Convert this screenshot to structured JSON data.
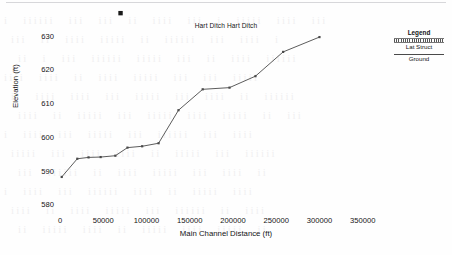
{
  "figure": {
    "title": "Hart Ditch Hart Ditch",
    "x_axis_title": "Main Channel Distance (ft)",
    "y_axis_title": "Elevation (ft)"
  },
  "legend": {
    "title": "Legend",
    "entries": [
      {
        "label": "Lat Struct",
        "style": "hatched-band",
        "color": "#555555"
      },
      {
        "label": "Ground",
        "style": "solid-line",
        "color": "#4a4a4a"
      }
    ]
  },
  "chart_data": {
    "type": "line",
    "title": "Hart Ditch Hart Ditch",
    "xlabel": "Main Channel Distance (ft)",
    "ylabel": "Elevation (ft)",
    "xlim": [
      0,
      370000
    ],
    "ylim": [
      578,
      632
    ],
    "xticks": [
      0,
      50000,
      100000,
      150000,
      200000,
      250000,
      300000,
      350000
    ],
    "xtick_labels": [
      "0",
      "50000",
      "100000",
      "150000",
      "200000",
      "250000",
      "300000",
      "350000"
    ],
    "yticks": [
      580,
      590,
      600,
      610,
      620,
      630
    ],
    "ytick_labels": [
      "580",
      "590",
      "600",
      "610",
      "620",
      "630"
    ],
    "grid": false,
    "axis_spines": false,
    "legend_position": "right-outside",
    "series": [
      {
        "name": "Ground",
        "type": "line",
        "color": "#4a4a4a",
        "marker": "square",
        "x": [
          2000,
          20000,
          33000,
          47000,
          64000,
          78000,
          95000,
          114000,
          137000,
          165000,
          196000,
          226000,
          258000,
          300000
        ],
        "y": [
          588.4,
          593.8,
          594.2,
          594.3,
          594.7,
          597.1,
          597.5,
          598.4,
          608.2,
          614.4,
          614.9,
          618.3,
          625.5,
          629.9
        ]
      },
      {
        "name": "Lat Struct",
        "type": "scatter",
        "color": "#1a1a1a",
        "marker": "square",
        "x": [
          70000
        ],
        "y": [
          637.0
        ]
      }
    ]
  },
  "background_text": {
    "note": "faint scanned page bleed-through",
    "lines": [
      "i  iiiiii   iii  iii   ii iiii   iii   i  iiiii  iiii   iii",
      "iii   ii    iiii   iiiii  ii  iiiiii   iii    iiii   i",
      "ii   i  iii   iiiiii  iiiii iii   ii   iiii  iiiiii",
      "iiii   iiii ii    iiii   iiiii   iii    iii   iiiii",
      "ii iiii  iiii  iii  iiiii    iii  iiii   ii  iiiiii",
      "iiii  ii iiiii  iii    iiiii  iiii   iiiii   ii  iii",
      "i   iiii   iii  iiiii   iii   iiiiii   iii    iiii",
      "iiiii  iii    iiii  iiii   ii   iiiii  iii  iiiiii",
      "iii   iiiiii  ii   iiii    iiiii   iii   iiii  ii",
      "i  iiii   iii iiiiii   iiii    ii  iiiii   iiii",
      "iiii   ii  iiii   iiiii  iii   iiiiii  ii   iiii",
      "ii  iiiii   iiii  ii   iiiii   iiii  iiiii   ii"
    ]
  }
}
